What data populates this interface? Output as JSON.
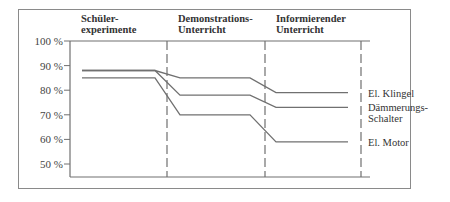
{
  "chart_data": {
    "type": "line",
    "title": "",
    "xlabel": "",
    "ylabel": "",
    "ylim": [
      45,
      100
    ],
    "yticks": [
      {
        "value": 100,
        "label": "100 %"
      },
      {
        "value": 90,
        "label": "90 %"
      },
      {
        "value": 80,
        "label": "80 %"
      },
      {
        "value": 70,
        "label": "70 %"
      },
      {
        "value": 60,
        "label": "60 %"
      },
      {
        "value": 50,
        "label": "50 %"
      }
    ],
    "phases": [
      {
        "line1": "Schüler-",
        "line2": "experimente"
      },
      {
        "line1": "Demonstrations-",
        "line2": "Unterricht"
      },
      {
        "line1": "Informierender",
        "line2": "Unterricht"
      }
    ],
    "series": [
      {
        "name": "El. Klingel",
        "label_lines": [
          "El. Klingel"
        ],
        "values": [
          88,
          85,
          79
        ]
      },
      {
        "name": "Dämmerungs-Schalter",
        "label_lines": [
          "Dämmerungs-",
          "Schalter"
        ],
        "values": [
          88,
          78,
          73
        ]
      },
      {
        "name": "El. Motor",
        "label_lines": [
          "El. Motor"
        ],
        "values": [
          85,
          70,
          59
        ]
      }
    ],
    "grid": false,
    "legend": "right (inline labels)"
  }
}
